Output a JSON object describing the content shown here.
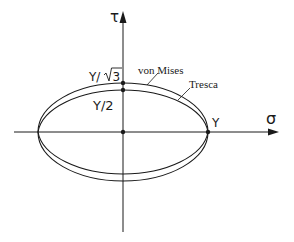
{
  "diagram": {
    "type": "yield-surface-comparison",
    "axes": {
      "horizontal": {
        "label": "σ"
      },
      "vertical": {
        "label": "τ"
      }
    },
    "curves": [
      {
        "name": "von Mises",
        "label": "von Mises",
        "tau_intercept_label": "Y/√3"
      },
      {
        "name": "Tresca",
        "label": "Tresca",
        "tau_intercept_label": "Y/2"
      }
    ],
    "points": {
      "sigma_intercept": "Y",
      "tau_von_mises": "Y/√3",
      "tau_tresca": "Y/2"
    },
    "labels": {
      "tau_axis": "τ",
      "sigma_axis": "σ",
      "von_mises": "von Mises",
      "tresca": "Tresca",
      "y_over_root3_prefix": "Y/",
      "root3_digit": "3",
      "y_over_2": "Y/2",
      "y": "Y"
    },
    "colors": {
      "stroke": "#1a1a1a",
      "background": "#ffffff"
    }
  }
}
